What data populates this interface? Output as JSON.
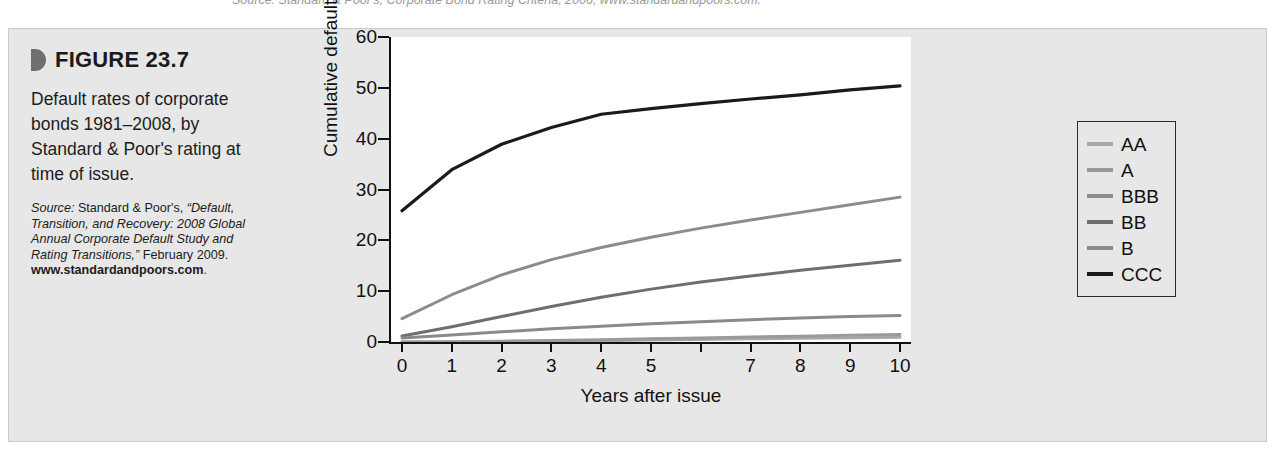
{
  "clipped_source_line": "Source: Standard & Poor's, Corporate Bond Rating Criteria, 2006, www.standardandpoors.com.",
  "figure": {
    "number_label": "FIGURE 23.7",
    "bullet_icon": "half-circle-bullet-icon",
    "caption": "Default rates of corporate bonds 1981–2008, by Standard & Poor's rating at time of issue.",
    "source": {
      "label": "Source:",
      "body": " Standard & Poor's, ",
      "title": "“Default, Transition, and Recovery: 2008 Global Annual Corporate Default Study and Rating Transitions,”",
      "date": " February 2009.",
      "url": "www.standardandpoors.com",
      "url_period": "."
    }
  },
  "chart_data": {
    "type": "line",
    "title": "",
    "xlabel": "Years after issue",
    "ylabel": "Cumulative default rate, %",
    "x": [
      0,
      1,
      2,
      3,
      4,
      5,
      6,
      7,
      8,
      9,
      10
    ],
    "xtick_labels": [
      "0",
      "1",
      "2",
      "3",
      "4",
      "5",
      "",
      "7",
      "8",
      "9",
      "10"
    ],
    "ytick_labels": [
      "0",
      "10",
      "20",
      "30",
      "40",
      "50",
      "60"
    ],
    "xlim": [
      0,
      10
    ],
    "ylim": [
      0,
      60
    ],
    "grid": false,
    "legend_position": "right-outside",
    "series": [
      {
        "name": "AA",
        "color": "#a8a8a8",
        "values": [
          0.0,
          0.02,
          0.07,
          0.15,
          0.26,
          0.38,
          0.5,
          0.62,
          0.72,
          0.82,
          0.92
        ]
      },
      {
        "name": "A",
        "color": "#9a9a9a",
        "values": [
          0.0,
          0.06,
          0.16,
          0.29,
          0.45,
          0.62,
          0.8,
          0.98,
          1.15,
          1.32,
          1.5
        ]
      },
      {
        "name": "BBB",
        "color": "#8c8c8c",
        "values": [
          4.6,
          9.3,
          13.2,
          16.2,
          18.6,
          20.6,
          22.4,
          24.0,
          25.5,
          27.0,
          28.5
        ]
      },
      {
        "name": "BB",
        "color": "#6e6e6e",
        "values": [
          1.2,
          3.0,
          5.0,
          7.0,
          8.8,
          10.4,
          11.8,
          13.0,
          14.1,
          15.1,
          16.1
        ]
      },
      {
        "name": "B",
        "color": "#8a8a8a",
        "values": [
          0.8,
          1.4,
          2.0,
          2.6,
          3.1,
          3.6,
          4.0,
          4.4,
          4.7,
          5.0,
          5.2
        ]
      },
      {
        "name": "CCC",
        "color": "#1a1a1a",
        "values": [
          25.8,
          33.9,
          38.9,
          42.2,
          44.8,
          45.9,
          46.9,
          47.8,
          48.6,
          49.6,
          50.4
        ]
      }
    ]
  },
  "legend": {
    "items": [
      {
        "label": "AA",
        "color": "#a8a8a8"
      },
      {
        "label": "A",
        "color": "#9a9a9a"
      },
      {
        "label": "BBB",
        "color": "#8c8c8c"
      },
      {
        "label": "BB",
        "color": "#6e6e6e"
      },
      {
        "label": "B",
        "color": "#8a8a8a"
      },
      {
        "label": "CCC",
        "color": "#1a1a1a"
      }
    ]
  }
}
